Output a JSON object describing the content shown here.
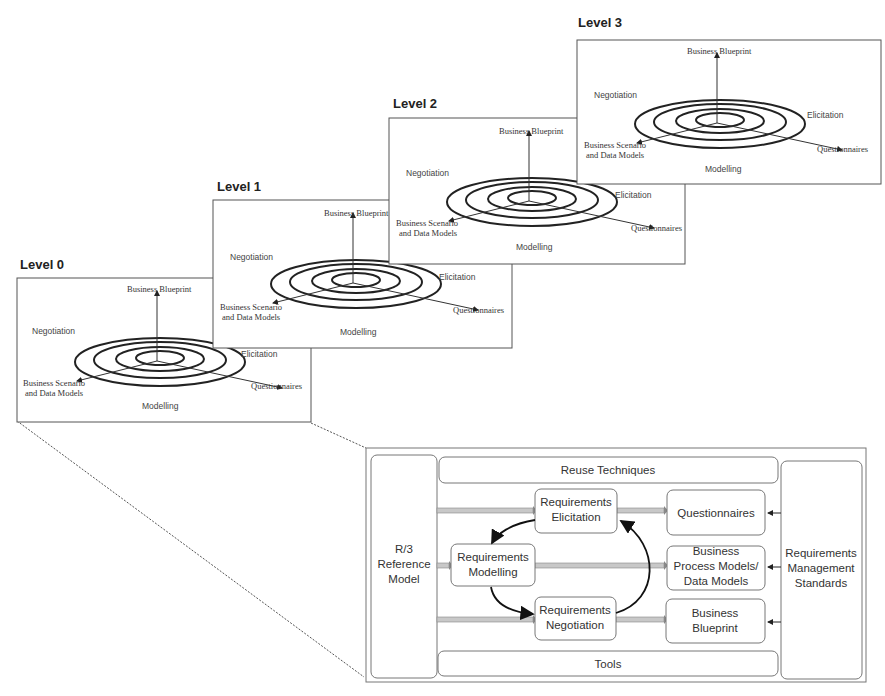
{
  "levels": [
    {
      "title": "Level 0",
      "x": 17,
      "y": 278,
      "w": 294,
      "h": 144
    },
    {
      "title": "Level 1",
      "x": 213,
      "y": 200,
      "w": 299,
      "h": 148
    },
    {
      "title": "Level 2",
      "x": 389,
      "y": 118,
      "w": 296,
      "h": 146
    },
    {
      "title": "Level 3",
      "x": 577,
      "y": 40,
      "w": 304,
      "h": 144
    }
  ],
  "spiral_labels": {
    "top": "Business Blueprint",
    "left": "Negotiation",
    "right": "Elicitation",
    "bottom_left_1": "Business Scenario",
    "bottom_left_2": "and Data Models",
    "bottom_right": "Questionnaires",
    "bottom": "Modelling"
  },
  "framework": {
    "left_column": [
      "R/3",
      "Reference",
      "Model"
    ],
    "top_bar": "Reuse Techniques",
    "bottom_bar": "Tools",
    "right_column": [
      "Requirements",
      "Management",
      "Standards"
    ],
    "elicitation": [
      "Requirements",
      "Elicitation"
    ],
    "modelling": [
      "Requirements",
      "Modelling"
    ],
    "negotiation": [
      "Requirements",
      "Negotiation"
    ],
    "questionnaires": [
      "Questionnaires"
    ],
    "process_models": [
      "Business",
      "Process Models/",
      "Data Models"
    ],
    "blueprint": [
      "Business",
      "Blueprint"
    ]
  }
}
